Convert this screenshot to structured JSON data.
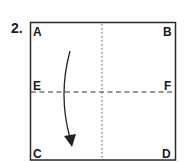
{
  "step": {
    "number": "2."
  },
  "corners": {
    "top_left": "A",
    "top_right": "B",
    "mid_left": "E",
    "mid_right": "F",
    "bottom_left": "C",
    "bottom_right": "D"
  },
  "lines": {
    "vertical_center": "dotted",
    "horizontal_center": "dashed"
  },
  "arrow": {
    "icon": "curved-arrow-down-icon",
    "direction": "down"
  },
  "colors": {
    "stroke": "#2a2a2a",
    "text": "#1a1a1a",
    "background": "#ffffff"
  }
}
